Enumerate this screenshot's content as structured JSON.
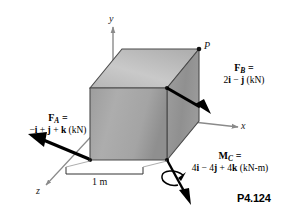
{
  "figure": {
    "number": "P4.124",
    "axes": {
      "y_label": "y",
      "x_label": "x",
      "z_label": "z"
    },
    "point": {
      "label": "P"
    },
    "dimension": {
      "label": "1 m"
    },
    "vectors": [
      {
        "id": "force-a",
        "name": "F",
        "subscript": "A",
        "equals": "=",
        "expression": "−i + j + k (kN)",
        "terms": [
          {
            "sign": "−",
            "coef": "",
            "unit": "i"
          },
          {
            "sign": "+",
            "coef": "",
            "unit": "j"
          },
          {
            "sign": "+",
            "coef": "",
            "unit": "k"
          }
        ],
        "units": "kN"
      },
      {
        "id": "force-b",
        "name": "F",
        "subscript": "B",
        "equals": "=",
        "expression": "2i − j (kN)",
        "terms": [
          {
            "sign": "",
            "coef": "2",
            "unit": "i"
          },
          {
            "sign": "−",
            "coef": "",
            "unit": "j"
          }
        ],
        "units": "kN"
      },
      {
        "id": "moment-c",
        "name": "M",
        "subscript": "C",
        "equals": "=",
        "expression": "4i − 4j + 4k (kN-m)",
        "terms": [
          {
            "sign": "",
            "coef": "4",
            "unit": "i"
          },
          {
            "sign": "−",
            "coef": "4",
            "unit": "j"
          },
          {
            "sign": "+",
            "coef": "4",
            "unit": "k"
          }
        ],
        "units": "kN-m"
      }
    ],
    "colors": {
      "background": "#ffffff",
      "cube_front": "#a8a8a8",
      "cube_top": "#c4c4c4",
      "cube_right": "#999999",
      "outline": "#4a4a4a",
      "axis": "#8a8a8a",
      "arrow": "#000000",
      "text": "#000000"
    }
  }
}
